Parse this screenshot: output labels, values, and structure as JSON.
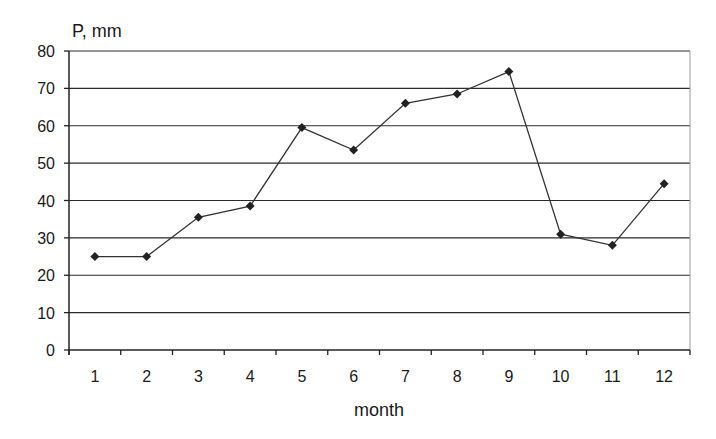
{
  "chart_data": {
    "type": "line",
    "title": "",
    "xlabel": "month",
    "ylabel": "P, mm",
    "categories": [
      "1",
      "2",
      "3",
      "4",
      "5",
      "6",
      "7",
      "8",
      "9",
      "10",
      "11",
      "12"
    ],
    "series": [
      {
        "name": "P",
        "values": [
          25,
          25,
          35.5,
          38.5,
          59.5,
          53.5,
          66,
          68.5,
          74.5,
          31,
          28,
          44.5
        ],
        "color": "#333333",
        "marker": "diamond"
      }
    ],
    "ylim": [
      0,
      80
    ],
    "yticks": [
      0,
      10,
      20,
      30,
      40,
      50,
      60,
      70,
      80
    ],
    "grid": true,
    "legend": null
  },
  "style": {
    "grid_color": "#2a2a2a",
    "line_color": "#333333",
    "marker_color": "#222222",
    "border_color": "#9a9a9a"
  }
}
